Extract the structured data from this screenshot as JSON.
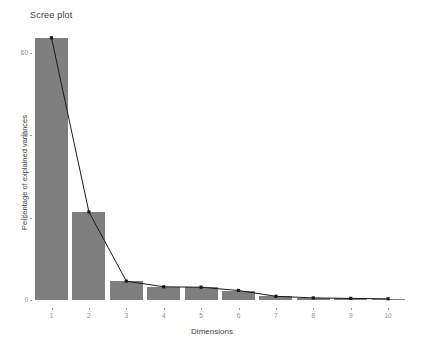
{
  "chart_data": {
    "type": "bar",
    "title": "Scree plot",
    "xlabel": "Dimensions",
    "ylabel": "Percentage of explained variances",
    "categories": [
      "1",
      "2",
      "3",
      "4",
      "5",
      "6",
      "7",
      "8",
      "9",
      "10"
    ],
    "values": [
      63.7,
      21.4,
      4.6,
      3.2,
      3.1,
      2.3,
      0.9,
      0.5,
      0.4,
      0.3
    ],
    "series": [
      {
        "name": "Percentage of explained variances",
        "values": [
          63.7,
          21.4,
          4.6,
          3.2,
          3.1,
          2.3,
          0.9,
          0.5,
          0.4,
          0.3
        ],
        "overlay": "line-with-points"
      }
    ],
    "ylim": [
      0,
      66
    ],
    "yticks": [
      0,
      20,
      40,
      60
    ],
    "ytick_labels": [
      "0",
      "20",
      "40",
      "60"
    ],
    "xtick_labels": [
      "1",
      "2",
      "3",
      "4",
      "5",
      "6",
      "7",
      "8",
      "9",
      "10"
    ],
    "grid": false,
    "legend": false,
    "legend_position": "none",
    "bar_color": "#7f7f7f",
    "line_color": "#1a1a1a",
    "point_color": "#1a1a1a",
    "background_color": "#ffffff",
    "axis_text_color": "#8f8f8f",
    "title_color": "#3d3d3d"
  },
  "plot": {
    "title": "Scree plot",
    "x_axis_title": "Dimensions",
    "y_axis_title": "Percentage of explained variances"
  }
}
